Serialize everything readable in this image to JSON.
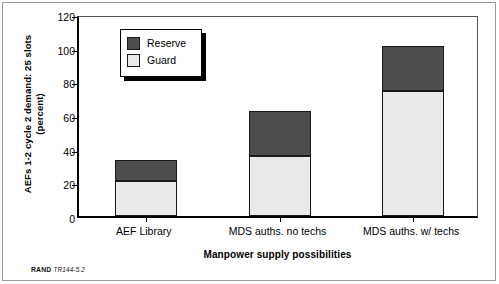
{
  "figure": {
    "footer_brand": "RAND",
    "footer_number": "TR144-5.2"
  },
  "legend": {
    "entries": [
      {
        "label": "Reserve",
        "color": "#4d4d4d",
        "swatch": "reserve-swatch-icon"
      },
      {
        "label": "Guard",
        "color": "#e9e9e9",
        "swatch": "guard-swatch-icon"
      }
    ]
  },
  "chart_data": {
    "type": "bar",
    "subtype": "stacked",
    "title": "",
    "xlabel": "Manpower supply possibilities",
    "ylabel": "AEFs 1-2 cycle 2 demand: 25 slots (percent)",
    "ylabel_line1": "AEFs 1-2 cycle 2 demand: 25 slots",
    "ylabel_line2": "(percent)",
    "categories": [
      "AEF Library",
      "MDS auths. no techs",
      "MDS auths. w/ techs"
    ],
    "series": [
      {
        "name": "Guard",
        "color": "#e9e9e9",
        "values": [
          21,
          35.5,
          74
        ]
      },
      {
        "name": "Reserve",
        "color": "#4d4d4d",
        "values": [
          12.5,
          27,
          27
        ]
      }
    ],
    "totals": [
      33.5,
      62.5,
      101
    ],
    "ylim": [
      0,
      120
    ],
    "yticks": [
      0,
      20,
      40,
      60,
      80,
      100,
      120
    ],
    "ytick_labels": [
      "0",
      "20",
      "40",
      "60",
      "80",
      "100",
      "120"
    ],
    "grid": false,
    "legend_position": "upper left"
  }
}
